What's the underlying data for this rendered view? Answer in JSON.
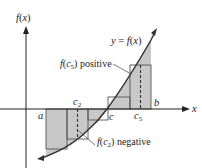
{
  "figure": {
    "type": "riemann-sum-midpoint-diagram",
    "y_axis_label": "f(x)",
    "x_axis_label": "x",
    "curve_label": "y = f(x)",
    "points": {
      "a": "a",
      "b": "b",
      "c": "c",
      "c2": "c",
      "c2_sub": "2",
      "c5": "c",
      "c5_sub": "5"
    },
    "annotations": {
      "positive": {
        "prefix": "f(c",
        "sub": "5",
        "suffix": ") positive"
      },
      "negative": {
        "prefix": "f(c",
        "sub": "2",
        "suffix": ") negative"
      }
    },
    "colors": {
      "shade": "#c8c8c8",
      "rect_stroke": "#555555",
      "axis": "#222222",
      "curve": "#333333"
    },
    "subintervals": 5
  }
}
